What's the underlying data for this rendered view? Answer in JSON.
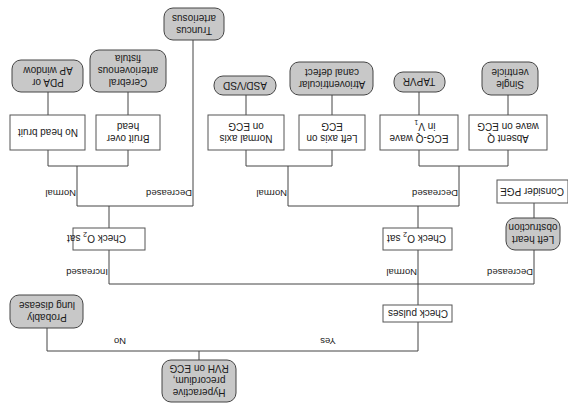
{
  "diagram": {
    "orientation": "rotated-180",
    "colors": {
      "terminal_fill": "#c8c8c8",
      "box_fill": "#ffffff",
      "line": "#444444"
    },
    "nodes": {
      "start": [
        "Hyperactive",
        "precordium,",
        "RVH on ECG"
      ],
      "probably_lung": [
        "Probably",
        "lung disease"
      ],
      "check_pulses": [
        "Check pulses"
      ],
      "check_o2_left_main": "Check O",
      "check_o2_left_sub": "2",
      "check_o2_left_tail": " sat",
      "check_o2_mid_main": "Check O",
      "check_o2_mid_sub": "2",
      "check_o2_mid_tail": " sat",
      "left_heart": [
        "Left heart",
        "obstruction"
      ],
      "consider_pge": [
        "Consider PGE"
      ],
      "no_head_bruit": [
        "No head bruit"
      ],
      "bruit_over_head": [
        "Bruit over",
        "head"
      ],
      "pda": [
        "PDA or",
        "AP window"
      ],
      "cerebral": [
        "Cerebral",
        "arteriovenous",
        "fistula"
      ],
      "truncus": [
        "Truncus",
        "arteriosus"
      ],
      "normal_axis": [
        "Normal axis",
        "on ECG"
      ],
      "left_axis": [
        "Left axis on",
        "ECG"
      ],
      "asd_vsd": [
        "ASD/VSD"
      ],
      "av_canal": [
        "Atrioventricular",
        "canal defect"
      ],
      "ecg_q_main": "ECG-Q wave",
      "ecg_q_line2": "in V",
      "ecg_q_sub": "1",
      "absent_q": [
        "Absent Q",
        "wave on ECG"
      ],
      "tapvr": [
        "TAPVR"
      ],
      "single_ventricle": [
        "Single",
        "ventricle"
      ]
    },
    "edge_labels": {
      "yes": "Yes",
      "no": "No",
      "increased": "Increased",
      "normal_mid": "Normal",
      "decreased_right": "Decreased",
      "normal_left": "Normal",
      "decreased_left": "Decreased",
      "normal_center": "Normal",
      "decreased_center": "Decreased"
    }
  }
}
